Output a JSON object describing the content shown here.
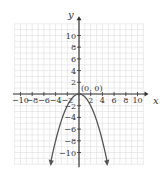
{
  "chart_data": {
    "type": "line",
    "title": "",
    "xlabel": "x",
    "ylabel": "y",
    "xlim": [
      -11,
      11
    ],
    "ylim": [
      -12,
      12
    ],
    "grid": true,
    "x_ticks": [
      -10,
      -8,
      -6,
      -4,
      -2,
      2,
      4,
      6,
      8,
      10
    ],
    "y_ticks": [
      10,
      8,
      6,
      4,
      2,
      -2,
      -4,
      -6,
      -8,
      -10
    ],
    "x_tick_labels": [
      "−10",
      "−8",
      "−6",
      "−4",
      "−2",
      "2",
      "4",
      "6",
      "8",
      "10"
    ],
    "y_tick_labels": [
      "10",
      "8",
      "6",
      "4",
      "2",
      "−2",
      "−4",
      "−6",
      "−8",
      "−10"
    ],
    "series": [
      {
        "name": "parabola",
        "equation": "y = -x^2/2",
        "x": [
          -4.8,
          -4,
          -3,
          -2,
          -1,
          0,
          1,
          2,
          3,
          4,
          4.8
        ],
        "values": [
          -11.5,
          -8,
          -4.5,
          -2,
          -0.5,
          0,
          -0.5,
          -2,
          -4.5,
          -8,
          -11.5
        ],
        "arrows_at_ends": true
      }
    ],
    "annotations": [
      {
        "text": "(0, 0)",
        "x": 0,
        "y": 0
      }
    ]
  },
  "colors": {
    "axis": "#333333",
    "grid": "#dddddd",
    "curve": "#555555"
  }
}
